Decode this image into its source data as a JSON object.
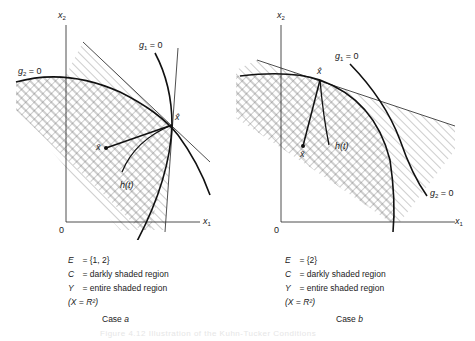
{
  "figure": {
    "caption": "Figure 4.12  Illustration of the Kuhn-Tucker Conditions",
    "panels": [
      {
        "id": "case-a",
        "axis_x_label": "x",
        "axis_x_sub": "1",
        "axis_y_label": "x",
        "axis_y_sub": "2",
        "origin_label": "0",
        "g1_label": "g",
        "g1_sub": "1",
        "g1_eq": " = 0",
        "g2_label": "g",
        "g2_sub": "2",
        "g2_eq": " = 0",
        "x_hat_label": "x̂",
        "x_bar_label": "x̄",
        "h_label": "h(t)",
        "legend": [
          {
            "sym": "E",
            "text": "= {1, 2}"
          },
          {
            "sym": "C",
            "text": "= darkly shaded region"
          },
          {
            "sym": "Y",
            "text": "= entire shaded region"
          },
          {
            "sym": "",
            "text": "(X = R²)"
          }
        ],
        "case_label": "Case",
        "case_letter": "a"
      },
      {
        "id": "case-b",
        "axis_x_label": "x",
        "axis_x_sub": "1",
        "axis_y_label": "x",
        "axis_y_sub": "2",
        "origin_label": "0",
        "g1_label": "g",
        "g1_sub": "1",
        "g1_eq": " = 0",
        "g2_label": "g",
        "g2_sub": "2",
        "g2_eq": " = 0",
        "x_hat_label": "x̂",
        "x_bar_label": "x̄",
        "h_label": "h(t)",
        "legend": [
          {
            "sym": "E",
            "text": "= {2}"
          },
          {
            "sym": "C",
            "text": "= darkly shaded region"
          },
          {
            "sym": "Y",
            "text": "= entire shaded region"
          },
          {
            "sym": "",
            "text": "(X = R²)"
          }
        ],
        "case_label": "Case",
        "case_letter": "b"
      }
    ]
  }
}
